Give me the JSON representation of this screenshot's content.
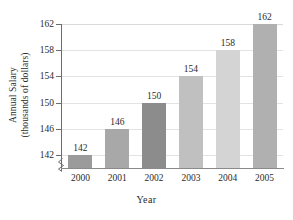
{
  "chart_data": {
    "type": "bar",
    "title": "",
    "categories": [
      "2000",
      "2001",
      "2002",
      "2003",
      "2004",
      "2005"
    ],
    "values": [
      142,
      146,
      150,
      154,
      158,
      162
    ],
    "data_labels": [
      "142",
      "146",
      "150",
      "154",
      "158",
      "162"
    ],
    "xlabel": "Year",
    "ylabel_line1": "Annual Salary",
    "ylabel_line2": "(thousands of dollars)",
    "ylabel": "Annual Salary (thousands of dollars)",
    "yticks": [
      142,
      146,
      150,
      154,
      158,
      162
    ],
    "ytick_labels": [
      "142",
      "146",
      "150",
      "154",
      "158",
      "162"
    ],
    "ylim": [
      140,
      162
    ],
    "y_axis_break": true,
    "grid": true,
    "grid_axis": "y",
    "legend": "none",
    "bar_colors": [
      "#9b9b9b",
      "#a8a8a8",
      "#8c8c8c",
      "#c0c0c0",
      "#d4d4d4",
      "#b0b0b0"
    ],
    "series": [
      {
        "name": "Annual Salary",
        "values": [
          142,
          146,
          150,
          154,
          158,
          162
        ]
      }
    ],
    "points": [
      {
        "category": "2000",
        "value": 142,
        "label": "142",
        "color": "#9b9b9b"
      },
      {
        "category": "2001",
        "value": 146,
        "label": "146",
        "color": "#a8a8a8"
      },
      {
        "category": "2002",
        "value": 150,
        "label": "150",
        "color": "#8c8c8c"
      },
      {
        "category": "2003",
        "value": 154,
        "label": "154",
        "color": "#c0c0c0"
      },
      {
        "category": "2004",
        "value": 158,
        "label": "158",
        "color": "#d4d4d4"
      },
      {
        "category": "2005",
        "value": 162,
        "label": "162",
        "color": "#b0b0b0"
      }
    ],
    "axis_color": "#6d6d6d",
    "grid_color": "#e3e3e3"
  }
}
